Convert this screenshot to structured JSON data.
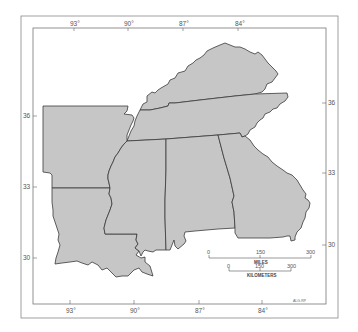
{
  "map": {
    "title": "",
    "region": "Southeastern United States",
    "fill_color": "#c6c6c6",
    "stroke_color": "#3a3a3a",
    "frame_color": "#777777",
    "states": [
      {
        "name": "Kentucky"
      },
      {
        "name": "Tennessee"
      },
      {
        "name": "Arkansas"
      },
      {
        "name": "Louisiana"
      },
      {
        "name": "Mississippi"
      },
      {
        "name": "Alabama"
      },
      {
        "name": "Georgia"
      }
    ],
    "graticule": {
      "top_longitudes": [
        "93°",
        "90°",
        "87°",
        "84°"
      ],
      "bottom_longitudes": [
        "93°",
        "90°",
        "87°",
        "84°"
      ],
      "left_latitudes": [
        "36",
        "33",
        "30"
      ],
      "right_latitudes": [
        "36",
        "33",
        "30"
      ]
    },
    "scale_bar": {
      "miles": {
        "ticks": [
          "0",
          "150",
          "300"
        ],
        "label": "MILES"
      },
      "kilometers": {
        "ticks": [
          "0",
          "150",
          "300"
        ],
        "label": "KILOMETERS"
      }
    },
    "credit": "ALG-RP"
  }
}
